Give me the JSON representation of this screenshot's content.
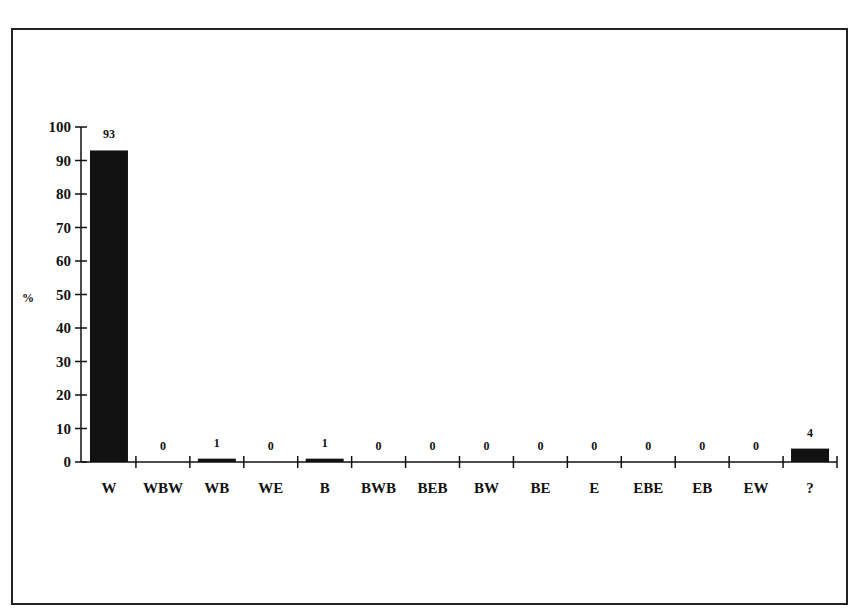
{
  "chart_data": {
    "type": "bar",
    "title": "",
    "xlabel": "",
    "ylabel": "%",
    "ylim": [
      0,
      100
    ],
    "yticks": [
      0,
      10,
      20,
      30,
      40,
      50,
      60,
      70,
      80,
      90,
      100
    ],
    "grid": false,
    "legend": "none",
    "categories": [
      "W",
      "WBW",
      "WB",
      "WE",
      "B",
      "BWB",
      "BEB",
      "BW",
      "BE",
      "E",
      "EBE",
      "EB",
      "EW",
      "?"
    ],
    "values": [
      93,
      0,
      1,
      0,
      1,
      0,
      0,
      0,
      0,
      0,
      0,
      0,
      0,
      4
    ],
    "data_labels": [
      "93",
      "0",
      "1",
      "0",
      "1",
      "0",
      "0",
      "0",
      "0",
      "0",
      "0",
      "0",
      "0",
      "4"
    ],
    "bar_color": "#111111"
  }
}
